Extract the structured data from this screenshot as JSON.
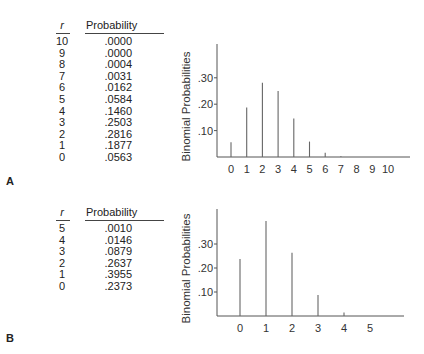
{
  "panels": [
    {
      "label": "A",
      "table": {
        "col_r": "r",
        "col_p": "Probability",
        "rows": [
          {
            "r": "10",
            "p": ".0000"
          },
          {
            "r": "9",
            "p": ".0000"
          },
          {
            "r": "8",
            "p": ".0004"
          },
          {
            "r": "7",
            "p": ".0031"
          },
          {
            "r": "6",
            "p": ".0162"
          },
          {
            "r": "5",
            "p": ".0584"
          },
          {
            "r": "4",
            "p": ".1460"
          },
          {
            "r": "3",
            "p": ".2503"
          },
          {
            "r": "2",
            "p": ".2816"
          },
          {
            "r": "1",
            "p": ".1877"
          },
          {
            "r": "0",
            "p": ".0563"
          }
        ]
      }
    },
    {
      "label": "B",
      "table": {
        "col_r": "r",
        "col_p": "Probability",
        "rows": [
          {
            "r": "5",
            "p": ".0010"
          },
          {
            "r": "4",
            "p": ".0146"
          },
          {
            "r": "3",
            "p": ".0879"
          },
          {
            "r": "2",
            "p": ".2637"
          },
          {
            "r": "1",
            "p": ".3955"
          },
          {
            "r": "0",
            "p": ".2373"
          }
        ]
      }
    }
  ],
  "chart_data": [
    {
      "type": "bar",
      "title": "",
      "xlabel": "",
      "ylabel": "Binomial Probabilities",
      "categories": [
        "0",
        "1",
        "2",
        "3",
        "4",
        "5",
        "6",
        "7",
        "8",
        "9",
        "10"
      ],
      "values": [
        0.0563,
        0.1877,
        0.2816,
        0.2503,
        0.146,
        0.0584,
        0.0162,
        0.0031,
        0.0004,
        0.0,
        0.0
      ],
      "yticks": [
        ".10",
        ".20",
        ".30"
      ],
      "ylim": [
        0,
        0.42
      ],
      "grid": false
    },
    {
      "type": "bar",
      "title": "",
      "xlabel": "",
      "ylabel": "Binomial Probabilities",
      "categories": [
        "0",
        "1",
        "2",
        "3",
        "4",
        "5"
      ],
      "values": [
        0.2373,
        0.3955,
        0.2637,
        0.0879,
        0.0146,
        0.001
      ],
      "yticks": [
        ".10",
        ".20",
        ".30"
      ],
      "ylim": [
        0,
        0.44
      ],
      "grid": false
    }
  ]
}
